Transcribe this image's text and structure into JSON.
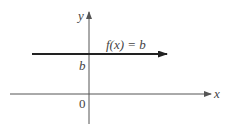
{
  "diagram": {
    "type": "function-graph",
    "axes": {
      "x_label": "x",
      "y_label": "y",
      "origin_label": "0"
    },
    "function": {
      "label": "f(x) = b",
      "kind": "constant horizontal line",
      "intercept_label": "b"
    },
    "colors": {
      "axis": "#555555",
      "line": "#222222",
      "text": "#444444"
    }
  }
}
